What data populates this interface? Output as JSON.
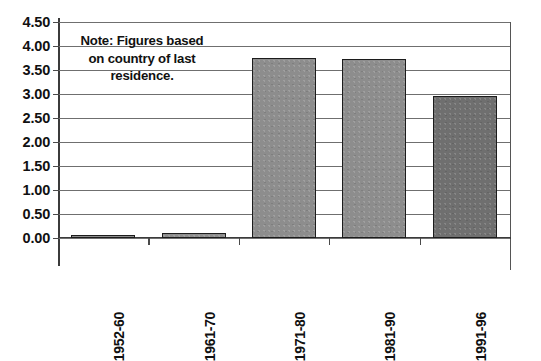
{
  "chart_data": {
    "type": "bar",
    "title": "",
    "subtitle": "",
    "xlabel": "",
    "ylabel": "",
    "categories": [
      "1952-60",
      "1961-70",
      "1971-80",
      "1981-90",
      "1991-96"
    ],
    "values": [
      0.02,
      0.1,
      3.75,
      3.72,
      2.95
    ],
    "series": [
      {
        "name": "",
        "values": [
          0.02,
          0.1,
          3.75,
          3.72,
          2.95
        ]
      }
    ],
    "ylim": [
      0.0,
      4.5
    ],
    "ytick_step": 0.5,
    "ytick_labels": [
      "0.00",
      "0.50",
      "1.00",
      "1.50",
      "2.00",
      "2.50",
      "3.00",
      "3.50",
      "4.00",
      "4.50"
    ],
    "ytick_values": [
      0.0,
      0.5,
      1.0,
      1.5,
      2.0,
      2.5,
      3.0,
      3.5,
      4.0,
      4.5
    ],
    "grid": true,
    "grid_axis": "y",
    "legend": false,
    "legend_position": "none",
    "xtick_rotation": -90,
    "bar_colors": [
      "#8d8d8d",
      "#8d8d8d",
      "#8d8d8d",
      "#8d8d8d",
      "#6f6f6f"
    ],
    "bar_edge_color": "#1c1c1c",
    "gridline_color": "#6f6f6f",
    "axis_color": "#3b3b3b",
    "background_color": "#ffffff",
    "annotations": [
      {
        "name": "note",
        "lines": [
          "Note: Figures based",
          "on country of last",
          "residence."
        ],
        "text": "Note: Figures based on country of last residence."
      }
    ]
  }
}
